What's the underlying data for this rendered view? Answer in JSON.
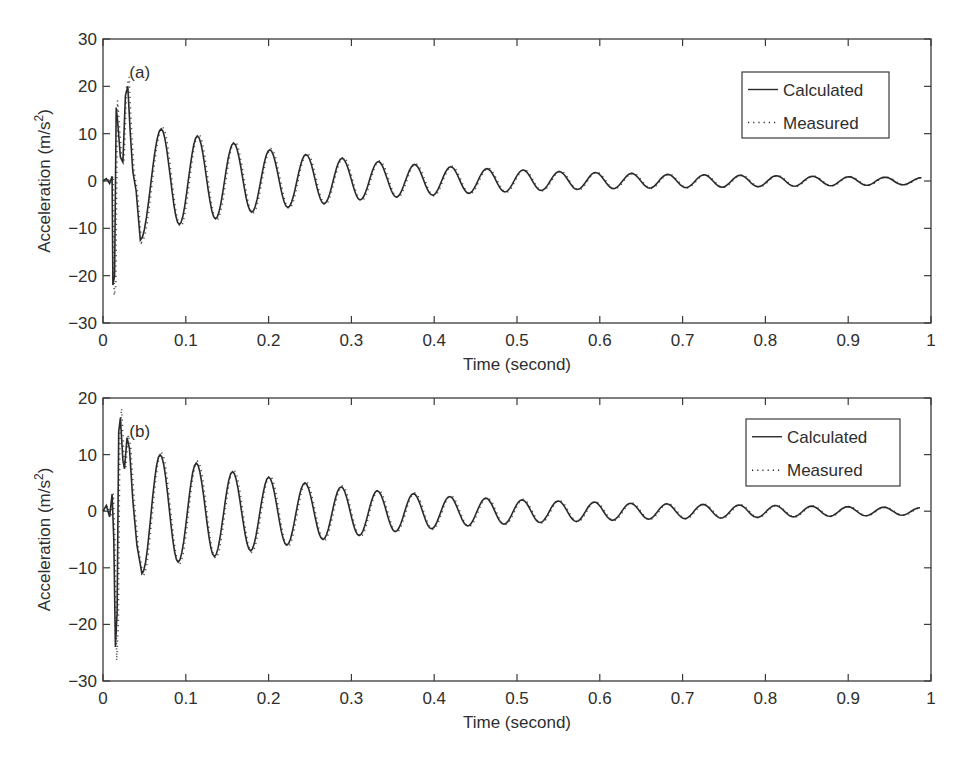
{
  "chart_data": [
    {
      "type": "line",
      "panel_label": "(a)",
      "xlabel": "Time (second)",
      "ylabel": "Acceleration (m/s²)",
      "xlim": [
        0,
        1
      ],
      "ylim": [
        -30,
        30
      ],
      "xticks": [
        "0",
        "0.1",
        "0.2",
        "0.3",
        "0.4",
        "0.5",
        "0.6",
        "0.7",
        "0.8",
        "0.9",
        "1"
      ],
      "yticks": [
        "30",
        "20",
        "10",
        "0",
        "−10",
        "−20",
        "−30"
      ],
      "ytick_values": [
        30,
        20,
        10,
        0,
        -10,
        -20,
        -30
      ],
      "legend": {
        "position": "upper right",
        "entries": [
          "Calculated",
          "Measured"
        ]
      },
      "grid": false,
      "series": [
        {
          "name": "Calculated",
          "style": "solid",
          "transient": [
            [
              0,
              0
            ],
            [
              0.004,
              0.5
            ],
            [
              0.008,
              -0.5
            ],
            [
              0.011,
              1
            ],
            [
              0.012,
              -22
            ],
            [
              0.014,
              -20
            ],
            [
              0.016,
              15.5
            ],
            [
              0.018,
              12
            ],
            [
              0.021,
              5
            ],
            [
              0.024,
              4
            ],
            [
              0.027,
              18
            ],
            [
              0.03,
              20
            ],
            [
              0.033,
              10
            ],
            [
              0.036,
              2
            ],
            [
              0.04,
              -2
            ],
            [
              0.045,
              -12.5
            ]
          ],
          "oscillation": {
            "start": 0.045,
            "period": 0.0437,
            "first_peak_time": 0.0703,
            "peaks": [
              11,
              9.5,
              8,
              6.6,
              5.6,
              4.8,
              4.1,
              3.5,
              3.0,
              2.6,
              2.3,
              2.0,
              1.8,
              1.6,
              1.4,
              1.3,
              1.2,
              1.1,
              1.0,
              0.9,
              0.8,
              0.7
            ],
            "troughs": [
              -12.5,
              -9.2,
              -8.0,
              -6.6,
              -5.6,
              -4.8,
              -4.0,
              -3.4,
              -3.0,
              -2.6,
              -2.3,
              -2.0,
              -1.8,
              -1.6,
              -1.5,
              -1.4,
              -1.3,
              -1.2,
              -1.1,
              -1.0,
              -0.9,
              -0.8
            ]
          },
          "values_note": "Decaying oscillation, ~22.9 Hz, final value ≈ 0 at t=1"
        },
        {
          "name": "Measured",
          "style": "dotted",
          "values_note": "Closely follows calculated curve; transient extremes ≈ +23.5 at t≈0.03 and ≈ −26 at t≈0.014"
        }
      ]
    },
    {
      "type": "line",
      "panel_label": "(b)",
      "xlabel": "Time (second)",
      "ylabel": "Acceleration (m/s²)",
      "xlim": [
        0,
        1
      ],
      "ylim": [
        -30,
        20
      ],
      "xticks": [
        "0",
        "0.1",
        "0.2",
        "0.3",
        "0.4",
        "0.5",
        "0.6",
        "0.7",
        "0.8",
        "0.9",
        "1"
      ],
      "yticks": [
        "20",
        "10",
        "0",
        "−10",
        "−20",
        "−30"
      ],
      "ytick_values": [
        20,
        10,
        0,
        -10,
        -20,
        -30
      ],
      "legend": {
        "position": "upper right",
        "entries": [
          "Calculated",
          "Measured"
        ]
      },
      "grid": false,
      "series": [
        {
          "name": "Calculated",
          "style": "solid",
          "transient": [
            [
              0,
              0
            ],
            [
              0.004,
              1
            ],
            [
              0.008,
              -1
            ],
            [
              0.011,
              3
            ],
            [
              0.013,
              -5
            ],
            [
              0.015,
              -24
            ],
            [
              0.017,
              -18
            ],
            [
              0.019,
              14
            ],
            [
              0.021,
              16.5
            ],
            [
              0.024,
              9
            ],
            [
              0.026,
              7.5
            ],
            [
              0.029,
              13
            ],
            [
              0.032,
              11
            ],
            [
              0.036,
              2
            ],
            [
              0.041,
              -6
            ],
            [
              0.047,
              -11
            ]
          ],
          "oscillation": {
            "start": 0.047,
            "period": 0.0437,
            "first_peak_time": 0.069,
            "peaks": [
              10,
              8.5,
              7,
              6,
              5,
              4.3,
              3.6,
              3.1,
              2.6,
              2.3,
              2.0,
              1.8,
              1.6,
              1.4,
              1.3,
              1.2,
              1.1,
              1.0,
              0.9,
              0.8,
              0.7,
              0.6
            ],
            "troughs": [
              -11,
              -9,
              -8,
              -7,
              -6,
              -5,
              -4.3,
              -3.6,
              -3.1,
              -2.6,
              -2.3,
              -2.0,
              -1.8,
              -1.6,
              -1.4,
              -1.3,
              -1.2,
              -1.1,
              -1.0,
              -0.9,
              -0.8,
              -0.7
            ]
          },
          "values_note": "Decaying oscillation, ~22.9 Hz, ends near −1 at t≈0.99"
        },
        {
          "name": "Measured",
          "style": "dotted",
          "values_note": "Closely follows calculated curve; transient extremes ≈ +16.5 at t≈0.02 and ≈ −24 at t≈0.015"
        }
      ]
    }
  ],
  "panels": [
    {
      "id": "a",
      "box": {
        "left": 103,
        "top": 39,
        "right": 931,
        "bottom": 323
      },
      "legend_box": {
        "left": 742,
        "top": 72,
        "right": 889,
        "bottom": 138
      }
    },
    {
      "id": "b",
      "box": {
        "left": 103,
        "top": 398,
        "right": 931,
        "bottom": 681
      },
      "legend_box": {
        "left": 746,
        "top": 419,
        "right": 900,
        "bottom": 486
      }
    }
  ],
  "colors": {
    "axis": "#3a3a3a",
    "line": "#2a2a2a",
    "text": "#2e2e2e",
    "background": "#ffffff"
  }
}
